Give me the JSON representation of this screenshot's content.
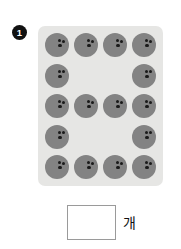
{
  "problem": {
    "number": "1",
    "answer_unit": "개",
    "answer_value": ""
  },
  "panel": {
    "background_color": "#e6e6e4",
    "ball_color": "#838383",
    "hole_color": "#1a1a1a"
  },
  "objects": {
    "item_name": "bowling-ball",
    "holes_per_ball": 3,
    "total_count": 16,
    "rows": [
      {
        "cells": [
          true,
          true,
          true,
          true
        ]
      },
      {
        "cells": [
          true,
          false,
          false,
          true
        ]
      },
      {
        "cells": [
          true,
          true,
          true,
          true
        ]
      },
      {
        "cells": [
          true,
          false,
          false,
          true
        ]
      },
      {
        "cells": [
          true,
          true,
          true,
          true
        ]
      }
    ]
  }
}
